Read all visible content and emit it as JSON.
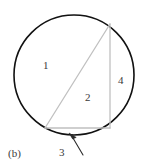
{
  "figure": {
    "caption": "(b)",
    "shape": "circle-with-inscribed-triangle",
    "colors": {
      "circle_stroke": "#111111",
      "triangle_stroke": "#c0c0c0",
      "label_text": "#3a3a3a",
      "arrow_stroke": "#2b2b2b",
      "background": "#ffffff"
    },
    "circle": {
      "center_x": 74,
      "center_y": 75,
      "radius": 60,
      "stroke_width": 1.6
    },
    "triangle": {
      "stroke_width": 1.2,
      "vertices": [
        {
          "name": "top-right-apex",
          "x": 110,
          "y": 24
        },
        {
          "name": "bottom-right",
          "x": 110,
          "y": 128
        },
        {
          "name": "bottom-left",
          "x": 45,
          "y": 128
        }
      ]
    },
    "arrow": {
      "tail_x": 83,
      "tail_y": 156,
      "head_x": 69,
      "head_y": 133,
      "stroke_width": 1.1
    },
    "regions": [
      {
        "id": "region-1",
        "label": "1",
        "description": "left circular segment outside triangle"
      },
      {
        "id": "region-2",
        "label": "2",
        "description": "interior of inscribed triangle"
      },
      {
        "id": "region-3",
        "label": "3",
        "description": "bottom circular segment below triangle base"
      },
      {
        "id": "region-4",
        "label": "4",
        "description": "right circular segment beside vertical leg"
      }
    ]
  }
}
